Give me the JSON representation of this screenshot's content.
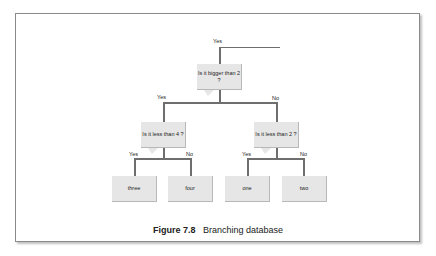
{
  "diagram": {
    "entry_label": "Yes",
    "root": {
      "question": "Is it bigger than 2 ?",
      "yes_label": "Yes",
      "no_label": "No"
    },
    "left": {
      "question": "Is it less than 4 ?",
      "yes_label": "Yes",
      "no_label": "No"
    },
    "right": {
      "question": "Is it less than 2 ?",
      "yes_label": "Yes",
      "no_label": "No"
    },
    "leaves": [
      "three",
      "four",
      "one",
      "two"
    ]
  },
  "caption": {
    "number": "Figure 7.8",
    "text": "Branching database"
  },
  "colors": {
    "box_fill": "#e6e6e6",
    "line": "#6e6e6e",
    "frame": "#8a8a8a"
  }
}
